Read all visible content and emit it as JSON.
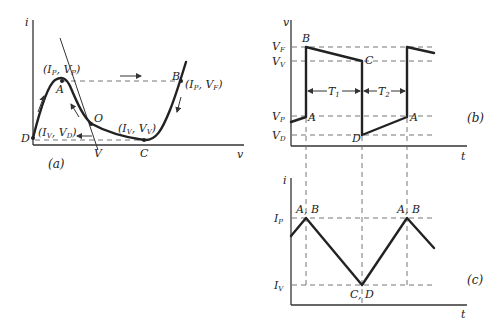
{
  "panel_a": {
    "label": "(a)",
    "y_axis": "i",
    "x_axis": "v",
    "points": {
      "A": {
        "name": "A",
        "coord_i": "I",
        "coord_i_sub": "P",
        "coord_v": "V",
        "coord_v_sub": "P"
      },
      "B": {
        "name": "B",
        "coord_i": "I",
        "coord_i_sub": "P",
        "coord_v": "V",
        "coord_v_sub": "F"
      },
      "C": {
        "name": "C",
        "coord_i": "I",
        "coord_i_sub": "V",
        "coord_v": "V",
        "coord_v_sub": "V"
      },
      "D": {
        "name": "D",
        "coord_i": "I",
        "coord_i_sub": "V",
        "coord_v": "V",
        "coord_v_sub": "D"
      },
      "O": {
        "name": "O"
      },
      "V": {
        "name": "V"
      }
    }
  },
  "panel_b": {
    "label": "(b)",
    "y_axis": "v",
    "x_axis": "t",
    "levels": [
      {
        "main": "V",
        "sub": "F"
      },
      {
        "main": "V",
        "sub": "V"
      },
      {
        "main": "V",
        "sub": "P"
      },
      {
        "main": "V",
        "sub": "D"
      }
    ],
    "points": {
      "A1": "A",
      "B": "B",
      "C": "C",
      "D": "D",
      "A2": "A"
    },
    "intervals": [
      {
        "main": "T",
        "sub": "1"
      },
      {
        "main": "T",
        "sub": "2"
      }
    ]
  },
  "panel_c": {
    "label": "(c)",
    "y_axis": "i",
    "x_axis": "t",
    "levels": [
      {
        "main": "I",
        "sub": "P"
      },
      {
        "main": "I",
        "sub": "V"
      }
    ],
    "points": {
      "peak1": "A, B",
      "trough": "C, D",
      "peak2": "A, B"
    }
  }
}
